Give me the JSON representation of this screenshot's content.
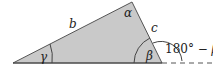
{
  "diagram": {
    "type": "triangle-with-exterior-angle",
    "fill_color": "#c9c9c9",
    "stroke_color": "#555555",
    "vertices": {
      "left": [
        13,
        63
      ],
      "top": [
        132,
        2
      ],
      "right": [
        162,
        63
      ]
    },
    "labels": {
      "side_b": "b",
      "side_c": "c",
      "angle_alpha": "α",
      "angle_beta": "β",
      "angle_gamma": "γ",
      "exterior_angle_number": "180°",
      "exterior_angle_minus": " − ",
      "exterior_angle_beta": "β"
    }
  }
}
